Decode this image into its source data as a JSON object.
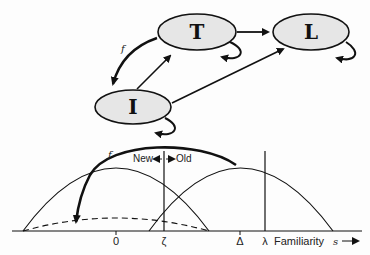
{
  "state_diagram": {
    "nodes": [
      {
        "id": "T",
        "label": "T"
      },
      {
        "id": "L",
        "label": "L"
      },
      {
        "id": "I",
        "label": "I"
      }
    ],
    "edges": [
      {
        "from": "T",
        "to": "I",
        "label": "f"
      },
      {
        "from": "I",
        "to": "T",
        "label": ""
      },
      {
        "from": "T",
        "to": "L",
        "label": ""
      },
      {
        "from": "I",
        "to": "L",
        "label": ""
      },
      {
        "from": "T",
        "to": "T",
        "label": ""
      },
      {
        "from": "L",
        "to": "L",
        "label": ""
      },
      {
        "from": "I",
        "to": "I",
        "label": ""
      }
    ],
    "node_fill": "#e6e6e6"
  },
  "familiarity_plot": {
    "f_label": "f",
    "new_label": "New",
    "old_label": "Old",
    "ticks": [
      "0",
      "ζ",
      "Δ",
      "λ"
    ],
    "axis_label": "Familiarity",
    "axis_var": "s"
  }
}
